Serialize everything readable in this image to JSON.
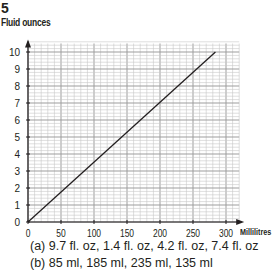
{
  "question_number": "5",
  "answers": {
    "a": "(a)  9.7 fl. oz, 1.4 fl. oz, 4.2 fl. oz, 7.4 fl. oz",
    "b": "(b)  85 ml, 185 ml, 235 ml, 135 ml"
  },
  "chart_data": {
    "type": "line",
    "title": "",
    "xlabel": "Millilitres",
    "ylabel": "Fluid ounces",
    "xlim": [
      0,
      320
    ],
    "ylim": [
      0,
      10.5
    ],
    "x_ticks": [
      0,
      50,
      100,
      150,
      200,
      250,
      300
    ],
    "y_ticks": [
      0,
      1,
      2,
      3,
      4,
      5,
      6,
      7,
      8,
      9,
      10
    ],
    "grid": true,
    "grid_minor_x": 10,
    "grid_minor_y": 0.2,
    "legend": null,
    "series": [
      {
        "name": "conversion",
        "x": [
          0,
          284
        ],
        "y": [
          0,
          10
        ]
      }
    ],
    "colors": {
      "line": "#231f20",
      "grid_major": "#9d9d9d",
      "grid_minor": "#c8c8c8",
      "axis": "#231f20"
    }
  }
}
